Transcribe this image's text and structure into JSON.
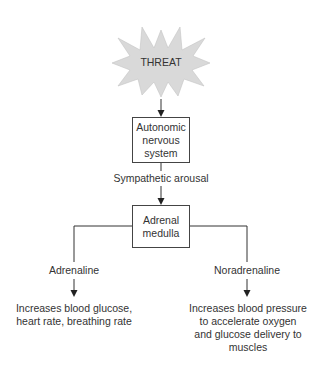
{
  "diagram": {
    "colors": {
      "burst_fill": "#d9d9d9",
      "line": "#333333",
      "text": "#333333"
    },
    "nodes": {
      "threat": {
        "label": "THREAT",
        "shape": "starburst"
      },
      "ans": {
        "label": "Autonomic nervous system",
        "lines": [
          "Autonomic",
          "nervous",
          "system"
        ],
        "shape": "box"
      },
      "sympathetic": {
        "label": "Sympathetic arousal",
        "shape": "edge-label"
      },
      "adrenal": {
        "label": "Adrenal medulla",
        "lines": [
          "Adrenal",
          "medulla"
        ],
        "shape": "box"
      },
      "adrenaline": {
        "label": "Adrenaline",
        "shape": "text"
      },
      "noradrenaline": {
        "label": "Noradrenaline",
        "shape": "text"
      },
      "adrenaline_effect": {
        "label": "Increases blood glucose, heart rate, breathing rate",
        "lines": [
          "Increases blood glucose,",
          "heart rate, breathing rate"
        ]
      },
      "noradrenaline_effect": {
        "label": "Increases blood pressure to accelerate oxygen and glucose delivery to muscles",
        "lines": [
          "Increases blood pressure",
          "to accelerate oxygen",
          "and glucose delivery to",
          "muscles"
        ]
      }
    },
    "edges": [
      {
        "from": "threat",
        "to": "ans",
        "arrow": true
      },
      {
        "from": "ans",
        "to": "adrenal",
        "label": "Sympathetic arousal",
        "arrow": true
      },
      {
        "from": "adrenal",
        "to": "adrenaline",
        "arrow": false
      },
      {
        "from": "adrenal",
        "to": "noradrenaline",
        "arrow": false
      },
      {
        "from": "adrenaline",
        "to": "adrenaline_effect",
        "arrow": true
      },
      {
        "from": "noradrenaline",
        "to": "noradrenaline_effect",
        "arrow": true
      }
    ]
  }
}
